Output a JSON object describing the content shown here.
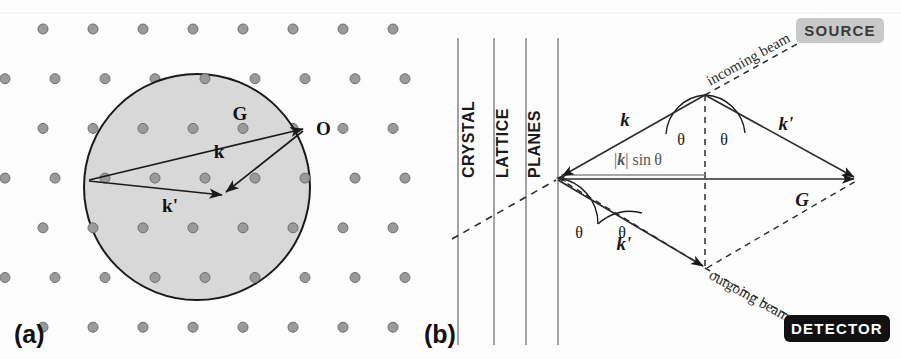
{
  "figure": {
    "width": 901,
    "height": 359,
    "background": "#fdfdfd"
  },
  "panel_a": {
    "label": "(a)",
    "description": "Ewald sphere construction on reciprocal lattice",
    "circle": {
      "cx": 197,
      "cy": 187,
      "r": 113,
      "fill": "#d6d6d6",
      "stroke": "#1a1a1a"
    },
    "lattice": {
      "dot_color": "#9a9a9a",
      "dot_stroke": "#6f6f6f",
      "dot_radius": 5,
      "row_spacing": 49.7,
      "col_spacing": 50,
      "row_shift": 12,
      "first_row_y": 29,
      "first_col_x": 43
    },
    "points": [
      {
        "name": "O",
        "label": "O",
        "x": 305,
        "y": 128
      },
      {
        "name": "k-prime-tip",
        "label": "",
        "x": 222,
        "y": 191
      },
      {
        "name": "G-tail",
        "label": "",
        "x": 89,
        "y": 180
      }
    ],
    "vectors": [
      {
        "name": "G",
        "label": "G",
        "from": [
          89,
          180
        ],
        "to": [
          303,
          129
        ],
        "label_x": 240,
        "label_y": 120
      },
      {
        "name": "k",
        "label": "k",
        "from": [
          303,
          131
        ],
        "to": [
          224,
          193
        ],
        "label_x": 219,
        "label_y": 158
      },
      {
        "name": "k-prime",
        "label": "k'",
        "from": [
          89,
          181
        ],
        "to": [
          224,
          195
        ],
        "label_x": 170,
        "label_y": 212
      }
    ]
  },
  "panel_b": {
    "label": "(b)",
    "description": "Bragg reflection geometry with crystal lattice planes",
    "column_labels": [
      "CRYSTAL",
      "LATTICE",
      "PLANES"
    ],
    "plane_lines_x": [
      458,
      494,
      526,
      558
    ],
    "plane_line_top": 38,
    "plane_line_bottom": 345,
    "plane_line_color": "#8c8c8c",
    "vertices": {
      "scatter": [
        558,
        178
      ],
      "apex_top": [
        705,
        95
      ],
      "apex_bottom": [
        705,
        268
      ],
      "right": [
        856,
        178
      ]
    },
    "vectors": [
      {
        "name": "k-incoming",
        "label": "k",
        "from": [
          705,
          95
        ],
        "to": [
          560,
          177
        ],
        "label_x": 625,
        "label_y": 124
      },
      {
        "name": "k-prime-upper",
        "label": "k'",
        "from": [
          705,
          95
        ],
        "to": [
          854,
          177
        ],
        "label_x": 785,
        "label_y": 128
      },
      {
        "name": "k-prime-lower",
        "label": "k'",
        "from": [
          558,
          180
        ],
        "to": [
          703,
          266
        ],
        "label_x": 623,
        "label_y": 247
      },
      {
        "name": "G",
        "label": "G",
        "from": [
          560,
          179
        ],
        "to": [
          854,
          179
        ],
        "label_x": 800,
        "label_y": 203
      },
      {
        "name": "k-sin-theta",
        "label": "|k| sin θ",
        "from": [
          561,
          174
        ],
        "to": [
          705,
          174
        ],
        "label_x": 615,
        "label_y": 163
      }
    ],
    "angle_labels": [
      {
        "name": "theta-top-left",
        "label": "θ",
        "x": 680,
        "y": 140
      },
      {
        "name": "theta-top-right",
        "label": "θ",
        "x": 722,
        "y": 140
      },
      {
        "name": "theta-bottom-left",
        "label": "θ",
        "x": 578,
        "y": 233
      },
      {
        "name": "theta-bottom-right",
        "label": "θ",
        "x": 620,
        "y": 233
      }
    ],
    "beam_labels": [
      {
        "name": "incoming-beam",
        "label": "incoming beam",
        "x": 712,
        "y": 88,
        "rotation": -29
      },
      {
        "name": "outgoing-beam",
        "label": "outgoing beam",
        "x": 710,
        "y": 276,
        "rotation": 29
      }
    ],
    "badges": [
      {
        "name": "source-badge",
        "label": "SOURCE",
        "x": 796,
        "y": 20,
        "width": 86,
        "height": 24,
        "fill": "#c8c8c8",
        "text_color": "#3a3a3a"
      },
      {
        "name": "detector-badge",
        "label": "DETECTOR",
        "x": 786,
        "y": 317,
        "width": 104,
        "height": 26,
        "fill": "#111111",
        "text_color": "#ffffff"
      }
    ],
    "dashed_lines": [
      {
        "name": "plane-trace",
        "from": [
          452,
          237
        ],
        "to": [
          560,
          178
        ]
      },
      {
        "name": "vertical-through-apexes",
        "from": [
          705,
          95
        ],
        "to": [
          705,
          268
        ]
      },
      {
        "name": "beam-extension-top",
        "from": [
          705,
          95
        ],
        "to": [
          800,
          42
        ]
      },
      {
        "name": "beam-extension-bottom",
        "from": [
          705,
          268
        ],
        "to": [
          800,
          322
        ]
      },
      {
        "name": "parallelogram-side",
        "from": [
          558,
          178
        ],
        "to": [
          705,
          268
        ]
      },
      {
        "name": "parallelogram-side-2",
        "from": [
          705,
          268
        ],
        "to": [
          856,
          180
        ]
      }
    ]
  }
}
